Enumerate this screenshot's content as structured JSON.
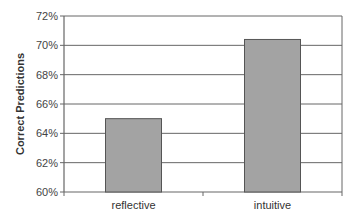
{
  "chart_data": {
    "type": "bar",
    "title": "",
    "xlabel": "",
    "ylabel": "Correct Predictions",
    "categories": [
      "reflective",
      "intuitive"
    ],
    "values": [
      65.0,
      70.4
    ],
    "value_unit": "%",
    "ylim": [
      60,
      72
    ],
    "yticks": [
      60,
      62,
      64,
      66,
      68,
      70,
      72
    ],
    "ytick_labels": [
      "60%",
      "62%",
      "64%",
      "66%",
      "68%",
      "70%",
      "72%"
    ],
    "grid": true,
    "legend": null
  },
  "colors": {
    "bar_fill": "#a3a3a3",
    "bar_stroke": "#555555",
    "grid": "#666666",
    "axis": "#666666"
  }
}
